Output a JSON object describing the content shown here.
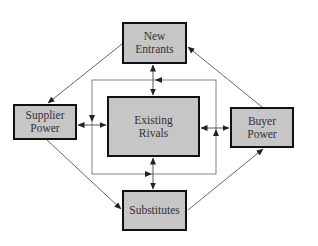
{
  "diagram": {
    "type": "porters-five-forces",
    "nodes": [
      {
        "id": "new_entrants",
        "label": "New\nEntrants"
      },
      {
        "id": "supplier_power",
        "label": "Supplier\nPower"
      },
      {
        "id": "existing_rivals",
        "label": "Existing\nRivals"
      },
      {
        "id": "buyer_power",
        "label": "Buyer\nPower"
      },
      {
        "id": "substitutes",
        "label": "Substitutes"
      }
    ],
    "edges": [
      {
        "from": "new_entrants",
        "to": "supplier_power",
        "style": "single-arrow"
      },
      {
        "from": "buyer_power",
        "to": "new_entrants",
        "style": "single-arrow"
      },
      {
        "from": "supplier_power",
        "to": "substitutes",
        "style": "single-arrow"
      },
      {
        "from": "substitutes",
        "to": "buyer_power",
        "style": "single-arrow"
      },
      {
        "from": "new_entrants",
        "to": "existing_rivals",
        "style": "double-arrow"
      },
      {
        "from": "supplier_power",
        "to": "existing_rivals",
        "style": "double-arrow"
      },
      {
        "from": "buyer_power",
        "to": "existing_rivals",
        "style": "double-arrow"
      },
      {
        "from": "substitutes",
        "to": "existing_rivals",
        "style": "double-arrow"
      },
      {
        "from": "loop",
        "to": "loop",
        "style": "counter-clockwise-ring around existing rivals"
      }
    ],
    "colors": {
      "box_fill": "#c6c6c6",
      "box_border": "#111111",
      "line": "#444444",
      "text": "#333333"
    }
  }
}
